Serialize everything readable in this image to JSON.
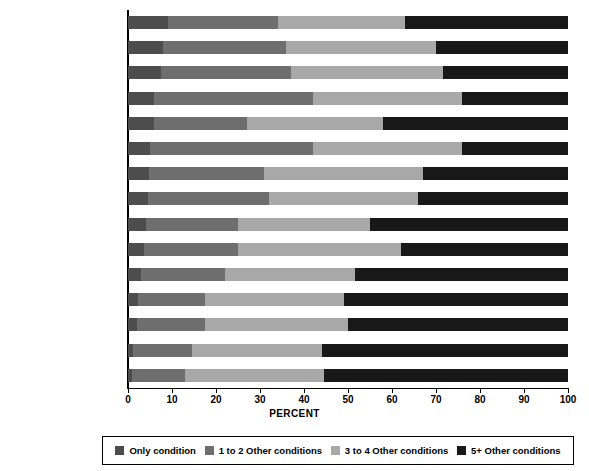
{
  "chart_data": {
    "type": "bar",
    "subtype": "horizontal-stacked-100",
    "title": "",
    "xlabel": "PERCENT",
    "ylabel": "",
    "xlim": [
      0,
      100
    ],
    "xticks": [
      0,
      10,
      20,
      30,
      40,
      50,
      60,
      70,
      80,
      90,
      100
    ],
    "grid": false,
    "legend_position": "bottom",
    "categories": [
      "Depression",
      "Cancer",
      "Arthritis",
      "High blood pressure",
      "Alzheimer's disease",
      "High cholesterol",
      "Diabetes",
      "Osteoporosis",
      "Asthma",
      "Ischemic heart disease",
      "COPD",
      "Atrial fibrillation",
      "Chronic kidney disease",
      "Stroke",
      "Heart failure"
    ],
    "series": [
      {
        "name": "Only condition",
        "color": "#4d4d4d",
        "values": [
          9,
          8,
          7.5,
          6,
          6,
          5,
          4.7,
          4.5,
          4,
          3.6,
          3,
          2.3,
          2,
          1.2,
          0.8
        ]
      },
      {
        "name": "1 to 2 Other conditions",
        "color": "#6e6e6e",
        "values": [
          25,
          28,
          29.5,
          36,
          21,
          37,
          26.3,
          27.5,
          21,
          21.4,
          19,
          15.2,
          15.5,
          13.3,
          12.2
        ]
      },
      {
        "name": "3 to 4 Other conditions",
        "color": "#a8a8a8",
        "values": [
          29,
          34,
          34.5,
          34,
          31,
          34,
          36,
          34,
          30,
          37,
          29.5,
          31.5,
          32.5,
          29.5,
          31.5
        ]
      },
      {
        "name": "5+ Other conditions",
        "color": "#181818",
        "values": [
          37,
          30,
          28.5,
          24,
          42,
          24,
          33,
          34,
          45,
          38,
          48.5,
          51,
          50,
          56,
          55.5
        ]
      }
    ]
  },
  "legend": {
    "items": [
      {
        "label": "Only condition",
        "color": "#4d4d4d"
      },
      {
        "label": "1 to 2 Other conditions",
        "color": "#6e6e6e"
      },
      {
        "label": "3 to 4 Other conditions",
        "color": "#a8a8a8"
      },
      {
        "label": "5+ Other conditions",
        "color": "#181818"
      }
    ]
  }
}
